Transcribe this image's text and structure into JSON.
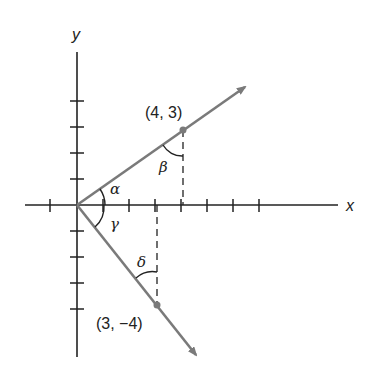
{
  "diagram": {
    "axes": {
      "x_label": "x",
      "y_label": "y"
    },
    "points": [
      {
        "label": "(4, 3)",
        "x": 4,
        "y": 3
      },
      {
        "label": "(3, −4)",
        "x": 3,
        "y": -4
      }
    ],
    "angles": {
      "alpha": "α",
      "beta": "β",
      "gamma": "γ",
      "delta": "δ"
    },
    "colors": {
      "vector": "#7a7a7a",
      "axis": "#222222"
    }
  }
}
